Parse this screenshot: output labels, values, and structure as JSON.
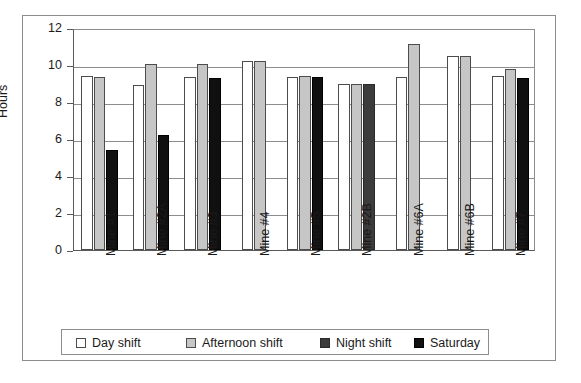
{
  "chart_data": {
    "type": "bar",
    "title": "",
    "xlabel": "",
    "ylabel": "Hours",
    "ylim": [
      0,
      12
    ],
    "yticks": [
      0,
      2,
      4,
      6,
      8,
      10,
      12
    ],
    "ytick_labels": [
      "0",
      "2",
      "4",
      "6",
      "8",
      "10",
      "12"
    ],
    "grid": true,
    "legend_position": "bottom",
    "categories": [
      "Mine #1",
      "Mine #2A",
      "Mine #3",
      "Mine #4",
      "Mine #5",
      "Mine #2B",
      "Mine #6A",
      "Mine #6B",
      "Mine #7"
    ],
    "series": [
      {
        "name": "Day shift",
        "color": "#ffffff",
        "values": [
          9.4,
          8.9,
          9.35,
          10.2,
          9.35,
          8.95,
          9.35,
          10.5,
          9.4
        ]
      },
      {
        "name": "Afternoon shift",
        "color": "#c6c6c6",
        "values": [
          9.35,
          10.05,
          10.05,
          10.2,
          9.4,
          8.95,
          11.15,
          10.5,
          9.8
        ]
      },
      {
        "name": "Night shift",
        "color": "#3c3c3c",
        "values": [
          null,
          null,
          null,
          null,
          null,
          8.95,
          null,
          null,
          null
        ]
      },
      {
        "name": "Saturday",
        "color": "#101010",
        "values": [
          5.4,
          6.2,
          9.3,
          null,
          9.35,
          null,
          null,
          null,
          9.3
        ]
      }
    ]
  },
  "legend": {
    "items": [
      {
        "label": "Day shift",
        "swatch": "day-shift-swatch"
      },
      {
        "label": "Afternoon shift",
        "swatch": "afternoon-shift-swatch"
      },
      {
        "label": "Night shift",
        "swatch": "night-shift-swatch"
      },
      {
        "label": "Saturday",
        "swatch": "saturday-swatch"
      }
    ]
  }
}
